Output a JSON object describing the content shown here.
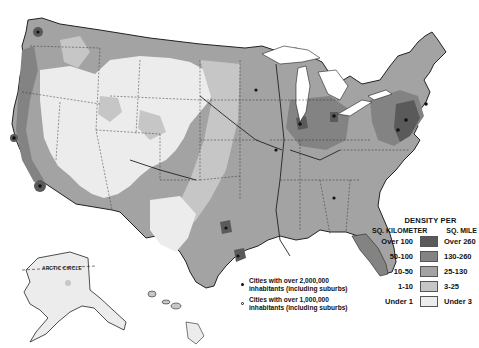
{
  "map": {
    "subject": "Population density of the United States",
    "title_fragment": "",
    "regions_shown": [
      "Contiguous United States",
      "Alaska",
      "Hawaii"
    ],
    "inset_labels": {
      "alaska": "ARCTIC CIRCLE"
    },
    "colors": {
      "over_100": "#5a5a5a",
      "50_100": "#838383",
      "10_50": "#a3a3a3",
      "1_10": "#c6c6c6",
      "under_1": "#ececec",
      "water_background": "#ffffff",
      "borders": "#222222"
    }
  },
  "legend": {
    "title": "DENSITY PER",
    "col_left_header": "SQ. KILOMETER",
    "col_right_header": "SQ. MILE",
    "rows": [
      {
        "km": "Over 100",
        "mile": "Over 260",
        "color": "#5a5a5a"
      },
      {
        "km": "50-100",
        "mile": "130-260",
        "color": "#838383"
      },
      {
        "km": "10-50",
        "mile": "25-130",
        "color": "#a3a3a3"
      },
      {
        "km": "1-10",
        "mile": "3-25",
        "color": "#c6c6c6"
      },
      {
        "km": "Under 1",
        "mile": "Under 3",
        "color": "#ececec"
      }
    ]
  },
  "cities_legend": [
    {
      "symbol": "solid-dot",
      "line1": "Cities  with  over 2,000,000",
      "line2": "inhabitants (including suburbs)"
    },
    {
      "symbol": "open-dot",
      "line1": "Cities  with  over 1,000,000",
      "line2": "inhabitants (including suburbs)"
    }
  ]
}
